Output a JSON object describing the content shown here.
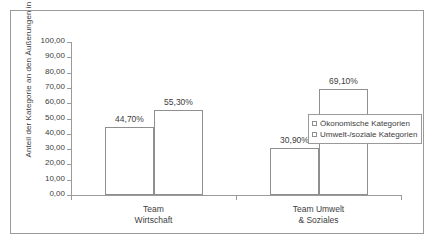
{
  "chart_data": {
    "type": "bar",
    "title": "",
    "xlabel": "",
    "ylabel": "Anteil der Kategorie an den Äußerungen in Prozent",
    "ylim": [
      0,
      100
    ],
    "grid": false,
    "legend_position": "right",
    "categories": [
      "Team Wirtschaft",
      "Team Umwelt & Soziales"
    ],
    "category_lines": [
      [
        "Team",
        "Wirtschaft"
      ],
      [
        "Team Umwelt",
        "& Soziales"
      ]
    ],
    "series": [
      {
        "name": "Ökonomische Kategorien",
        "values": [
          44.7,
          55.3
        ],
        "swatch_color": "#ffffff"
      },
      {
        "name": "Umwelt-/soziale Kategorien",
        "values": [
          30.9,
          69.1
        ],
        "swatch_color": "#ffffff"
      }
    ],
    "bars": [
      {
        "group": 0,
        "series": 0,
        "value": 44.7,
        "label": "44,70%"
      },
      {
        "group": 0,
        "series": 1,
        "value": 55.3,
        "label": "55,30%"
      },
      {
        "group": 1,
        "series": 0,
        "value": 30.9,
        "label": "30,90%"
      },
      {
        "group": 1,
        "series": 1,
        "value": 69.1,
        "label": "69,10%"
      }
    ],
    "y_ticks": [
      {
        "value": 0,
        "label": "0,00"
      },
      {
        "value": 10,
        "label": "10,00"
      },
      {
        "value": 20,
        "label": "20,00"
      },
      {
        "value": 30,
        "label": "30,00"
      },
      {
        "value": 40,
        "label": "40,00"
      },
      {
        "value": 50,
        "label": "50,00"
      },
      {
        "value": 60,
        "label": "60,00"
      },
      {
        "value": 70,
        "label": "70,00"
      },
      {
        "value": 80,
        "label": "80,00"
      },
      {
        "value": 90,
        "label": "90,00"
      },
      {
        "value": 100,
        "label": "100,00"
      }
    ]
  },
  "legend": {
    "items": [
      {
        "label": "Ökonomische Kategorien"
      },
      {
        "label": "Umwelt-/soziale Kategorien"
      }
    ]
  },
  "axes": {
    "y_title": "Anteil der Kategorie an den Äußerungen in Prozent"
  }
}
